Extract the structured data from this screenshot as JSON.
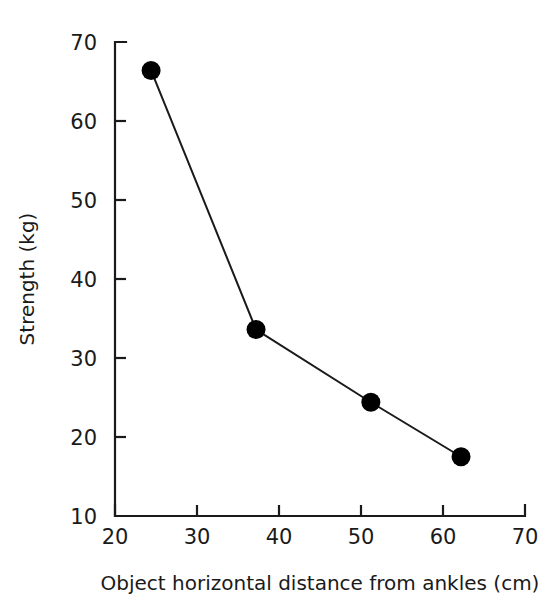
{
  "chart_data": {
    "type": "line",
    "title": "",
    "subtitle": "",
    "xlabel": "Object horizontal distance from ankles (cm)",
    "ylabel": "Strength (kg)",
    "xlim": [
      20,
      70
    ],
    "ylim": [
      10,
      70
    ],
    "xticks": [
      20,
      30,
      40,
      50,
      60,
      70
    ],
    "yticks": [
      10,
      20,
      30,
      40,
      50,
      60,
      70
    ],
    "xtick_labels": [
      "20",
      "30",
      "40",
      "50",
      "60",
      "70"
    ],
    "ytick_labels": [
      "10",
      "20",
      "30",
      "40",
      "50",
      "60",
      "70"
    ],
    "grid": false,
    "legend": false,
    "legend_position": "none",
    "x": [
      24.4,
      37.2,
      51.2,
      62.2
    ],
    "series": [
      {
        "name": "Strength",
        "values": [
          66.4,
          33.6,
          24.4,
          17.5
        ],
        "color": "#000000",
        "marker": "filled-circle",
        "marker_size": 19,
        "line_width": 2
      }
    ],
    "points": [
      {
        "x": 24.4,
        "y": 66.4
      },
      {
        "x": 37.2,
        "y": 33.6
      },
      {
        "x": 51.2,
        "y": 24.4
      },
      {
        "x": 62.2,
        "y": 17.5
      }
    ],
    "annotations": [],
    "background_color": "#ffffff",
    "axis_color": "#1a1a1a",
    "tick_direction": "in"
  }
}
